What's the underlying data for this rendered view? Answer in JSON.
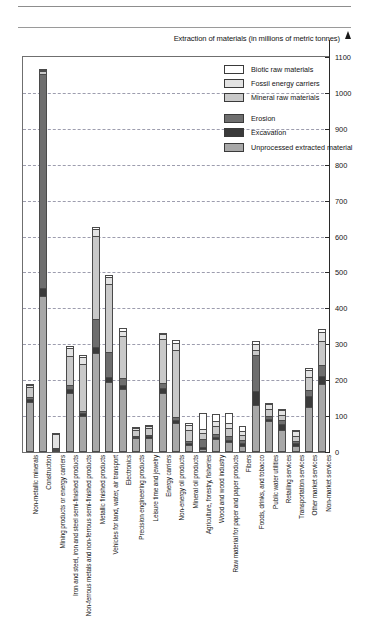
{
  "chart_data": {
    "type": "bar",
    "subtype": "stacked-bar",
    "title": "Extraction of materials (in millions of metric tonnes)",
    "xlabel": "",
    "ylabel": "Extraction of materials (in millions of metric tonnes)",
    "ylim": [
      0,
      1100
    ],
    "ytick_step": 100,
    "yticks": [
      0,
      100,
      200,
      300,
      400,
      500,
      600,
      700,
      800,
      900,
      1000,
      1100
    ],
    "ytick_labels": [
      "0",
      "100",
      "200",
      "300",
      "400",
      "500",
      "600",
      "700",
      "800",
      "900",
      "1000",
      "1100"
    ],
    "grid": true,
    "grid_style": "dashed-horizontal",
    "legend_position": "top-right-inside",
    "legend": [
      "Biotic raw materials",
      "Fossil energy carriers",
      "Mineral raw materials",
      "Erosion",
      "Excavation",
      "Unprocessed extracted material"
    ],
    "series_colors": {
      "Biotic raw materials": "#ffffff",
      "Fossil energy carriers": "#e3e3e3",
      "Mineral raw materials": "#c9c9c9",
      "Erosion": "#6e6e6e",
      "Excavation": "#3a3a3a",
      "Unprocessed extracted material": "#a8a8a8"
    },
    "categories": [
      "Non-metallic minerals",
      "Construction",
      "Mining products or energy carriers",
      "Iron and steel, iron and steel semi-finished products",
      "Non-ferrous metals and non-ferrous semi-finished products",
      "Metallic finished products",
      "Vehicles for land, water, air transport",
      "Electronics",
      "Precision engineering products",
      "Leisure time and jewelry",
      "Energy carriers",
      "Non-energy oil products",
      "Mineral oil products",
      "Agriculture, forestry, fisheries",
      "Wood and wood industry",
      "Raw material for paper and paper products",
      "Fibers",
      "Foods, drinks, and tobacco",
      "Public water utilities",
      "Retailing services",
      "Transportation services",
      "Other market services",
      "Non-market services"
    ],
    "series": [
      {
        "name": "Unprocessed extracted material",
        "values": [
          140,
          435,
          0,
          165,
          100,
          275,
          195,
          175,
          38,
          40,
          165,
          80,
          20,
          8,
          35,
          28,
          18,
          130,
          85,
          60,
          18,
          125,
          190
        ]
      },
      {
        "name": "Excavation",
        "values": [
          8,
          22,
          2,
          10,
          8,
          18,
          14,
          12,
          4,
          4,
          12,
          8,
          6,
          6,
          6,
          6,
          6,
          40,
          6,
          18,
          6,
          30,
          22
        ]
      },
      {
        "name": "Erosion",
        "values": [
          6,
          595,
          2,
          12,
          6,
          78,
          70,
          18,
          4,
          4,
          14,
          10,
          6,
          22,
          10,
          12,
          10,
          100,
          10,
          12,
          8,
          18,
          30
        ]
      },
      {
        "name": "Mineral raw materials",
        "values": [
          26,
          8,
          2,
          80,
          130,
          230,
          190,
          118,
          16,
          20,
          125,
          185,
          30,
          18,
          22,
          22,
          14,
          14,
          18,
          14,
          14,
          36,
          68
        ]
      },
      {
        "name": "Fossil energy carriers",
        "values": [
          8,
          5,
          38,
          22,
          20,
          20,
          18,
          14,
          6,
          5,
          12,
          22,
          12,
          10,
          14,
          14,
          10,
          18,
          14,
          12,
          12,
          20,
          24
        ]
      },
      {
        "name": "Biotic raw materials",
        "values": [
          2,
          3,
          2,
          6,
          6,
          6,
          6,
          8,
          2,
          2,
          4,
          6,
          8,
          46,
          20,
          28,
          16,
          8,
          4,
          4,
          4,
          6,
          8
        ]
      }
    ],
    "totals": [
      190,
      1068,
      46,
      295,
      270,
      627,
      493,
      345,
      70,
      75,
      332,
      311,
      82,
      110,
      107,
      110,
      74,
      310,
      137,
      120,
      62,
      235,
      342
    ]
  }
}
